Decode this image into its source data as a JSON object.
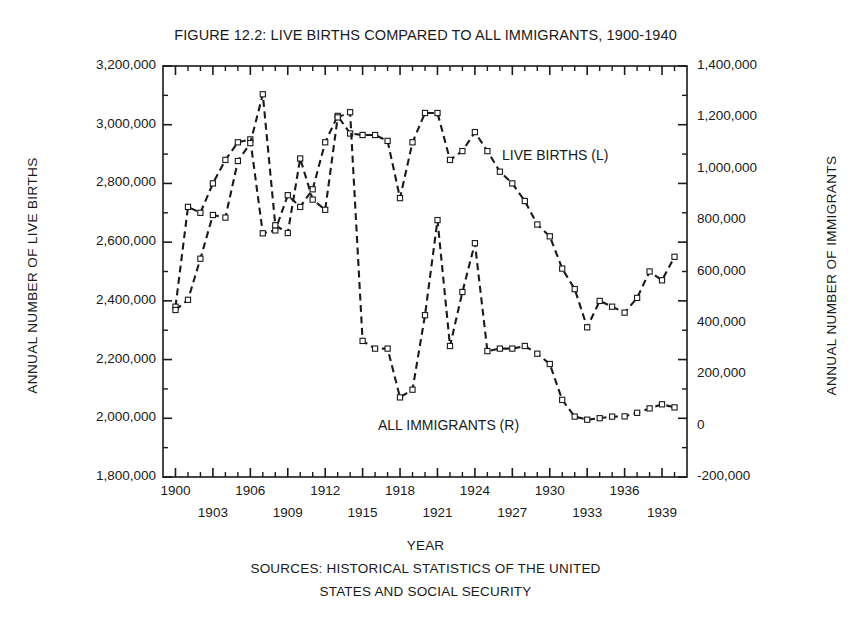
{
  "chart_data": {
    "type": "line",
    "title": "FIGURE 12.2: LIVE BIRTHS  COMPARED TO ALL IMMIGRANTS, 1900-1940",
    "xlabel": "YEAR",
    "ylabel": "ANNUAL NUMBER OF LIVE BIRTHS",
    "ylabel_right": "ANNUAL NUMBER OF IMMIGRANTS",
    "grid": false,
    "legend_position": "in-plot annotations",
    "xlim": [
      1899,
      1941
    ],
    "ylim": [
      1800000,
      3200000
    ],
    "ylim_right": [
      -200000,
      1400000
    ],
    "x": [
      1900,
      1901,
      1902,
      1903,
      1904,
      1905,
      1906,
      1907,
      1908,
      1909,
      1910,
      1911,
      1912,
      1913,
      1914,
      1915,
      1916,
      1917,
      1918,
      1919,
      1920,
      1921,
      1922,
      1923,
      1924,
      1925,
      1926,
      1927,
      1928,
      1929,
      1930,
      1931,
      1932,
      1933,
      1934,
      1935,
      1936,
      1937,
      1938,
      1939,
      1940
    ],
    "xticklabels_row1": [
      "1900",
      "1906",
      "1912",
      "1918",
      "1924",
      "1930",
      "1936"
    ],
    "xticklabels_row2": [
      "1903",
      "1909",
      "1915",
      "1921",
      "1927",
      "1933",
      "1939"
    ],
    "yticklabels_left": [
      "3,200,000",
      "3,000,000",
      "2,800,000",
      "2,600,000",
      "2,400,000",
      "2,200,000",
      "2,000,000",
      "1,800,000"
    ],
    "yticklabels_right": [
      "1,400,000",
      "1,200,000",
      "1,000,000",
      "800,000",
      "600,000",
      "400,000",
      "200,000",
      "0",
      "-200,000"
    ],
    "series": [
      {
        "name": "LIVE BIRTHS (L)",
        "axis": "left",
        "linestyle": "dashed",
        "marker": "open-square",
        "values": [
          2380000,
          2720000,
          2700000,
          2800000,
          2880000,
          2940000,
          2950000,
          2630000,
          2640000,
          2760000,
          2720000,
          2780000,
          2940000,
          3030000,
          2970000,
          2965000,
          2965000,
          2945000,
          2750000,
          2940000,
          3040000,
          3040000,
          2880000,
          2910000,
          2975000,
          2910000,
          2840000,
          2800000,
          2740000,
          2660000,
          2620000,
          2510000,
          2440000,
          2310000,
          2400000,
          2380000,
          2360000,
          2410000,
          2500000,
          2470000,
          2550000
        ]
      },
      {
        "name": "ALL IMMIGRANTS (R)",
        "axis": "right",
        "linestyle": "dashed",
        "marker": "open-square",
        "values": [
          450000,
          490000,
          650000,
          820000,
          810000,
          1030000,
          1100000,
          1290000,
          780000,
          750000,
          1040000,
          880000,
          840000,
          1200000,
          1220000,
          330000,
          300000,
          300000,
          110000,
          140000,
          430000,
          800000,
          310000,
          520000,
          710000,
          290000,
          300000,
          300000,
          310000,
          280000,
          240000,
          100000,
          35000,
          23000,
          29000,
          35000,
          36000,
          50000,
          67000,
          83000,
          71000
        ]
      }
    ]
  },
  "labels": {
    "births_annotation": "LIVE BIRTHS (L)",
    "immigrants_annotation": "ALL IMMIGRANTS (R)"
  },
  "footer": {
    "year": "YEAR",
    "sources_line1": "SOURCES: HISTORICAL STATISTICS OF THE UNITED",
    "sources_line2": "STATES AND SOCIAL SECURITY"
  },
  "colors": {
    "ink": "#1a1a1a",
    "background": "#ffffff"
  }
}
